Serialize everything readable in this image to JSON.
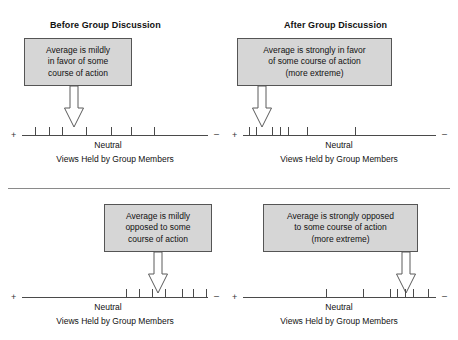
{
  "figure": {
    "divider": {
      "name": "horizontal-rule"
    }
  },
  "panels": [
    {
      "id": "before-group-discussion",
      "title": "Before Group Discussion",
      "callout": {
        "lines": [
          "Average is mildly",
          "in favor of some",
          "course of action"
        ]
      },
      "axis": {
        "positive_sign": "+",
        "negative_sign": "–",
        "neutral_label": "Neutral",
        "caption": "Views Held by Group Members",
        "tick_positions_pct": [
          7.0,
          14.5,
          21.5,
          34.5,
          48.0,
          58.5,
          71.0
        ]
      }
    },
    {
      "id": "after-group-discussion",
      "title": "After Group Discussion",
      "callout": {
        "lines": [
          "Average is strongly in favor",
          "of some course of action",
          "(more extreme)"
        ]
      },
      "axis": {
        "positive_sign": "+",
        "negative_sign": "–",
        "neutral_label": "Neutral",
        "caption": "Views Held by Group Members",
        "tick_positions_pct": [
          3.0,
          6.5,
          15.0,
          19.0,
          23.5,
          33.0,
          58.0
        ]
      }
    },
    {
      "id": "before-group-discussion-opposed",
      "title": "",
      "callout": {
        "lines": [
          "Average is mildly",
          "opposed to some",
          "course of action"
        ]
      },
      "axis": {
        "positive_sign": "+",
        "negative_sign": "–",
        "neutral_label": "Neutral",
        "caption": "Views Held by Group Members",
        "tick_positions_pct": [
          56.0,
          63.0,
          70.0,
          77.0,
          86.0,
          92.0,
          99.0
        ]
      }
    },
    {
      "id": "after-group-discussion-opposed",
      "title": "",
      "callout": {
        "lines": [
          "Average is strongly opposed",
          "to some course of action",
          "(more extreme)"
        ]
      },
      "axis": {
        "positive_sign": "+",
        "negative_sign": "–",
        "neutral_label": "Neutral",
        "caption": "Views Held by Group Members",
        "tick_positions_pct": [
          43.0,
          62.0,
          76.0,
          80.0,
          84.0,
          88.0,
          96.0
        ]
      }
    }
  ],
  "colors": {
    "box_fill": "#d6d6d6",
    "box_border": "#555555",
    "axis": "#4a4a4a",
    "text": "#111111"
  }
}
